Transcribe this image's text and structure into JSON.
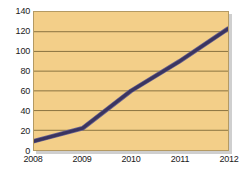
{
  "chart_data": {
    "type": "line",
    "title": "",
    "subtitle": "",
    "xlabel": "",
    "ylabel": "",
    "categories": [
      "2008",
      "2009",
      "2010",
      "2011",
      "2012"
    ],
    "x": [
      2008,
      2009,
      2010,
      2011,
      2012
    ],
    "values": [
      9,
      22,
      60,
      90,
      123
    ],
    "series": [
      {
        "name": "",
        "values": [
          9,
          22,
          60,
          90,
          123
        ]
      }
    ],
    "ylim": [
      0,
      140
    ],
    "xlim": [
      2008,
      2012
    ],
    "yticks": [
      0,
      20,
      40,
      60,
      80,
      100,
      120,
      140
    ],
    "ytick_labels": [
      "0",
      "20",
      "40",
      "60",
      "80",
      "100",
      "120",
      "140"
    ],
    "xtick_labels": [
      "2008",
      "2009",
      "2010",
      "2011",
      "2012"
    ],
    "grid": {
      "horizontal": true,
      "vertical": false
    },
    "legend": {
      "visible": false,
      "position": "none",
      "entries": []
    },
    "annotations": [],
    "colors": {
      "plot_background": "#f3cf89",
      "grid_line": "#8a7340",
      "plot_border": "#b49a63",
      "series_line": "#3b3560",
      "series_line_highlight": "#6b6490",
      "page_background": "#ffffff",
      "tick_label": "#1a1a1a",
      "drop_shadow": "#cfcfcf"
    }
  }
}
